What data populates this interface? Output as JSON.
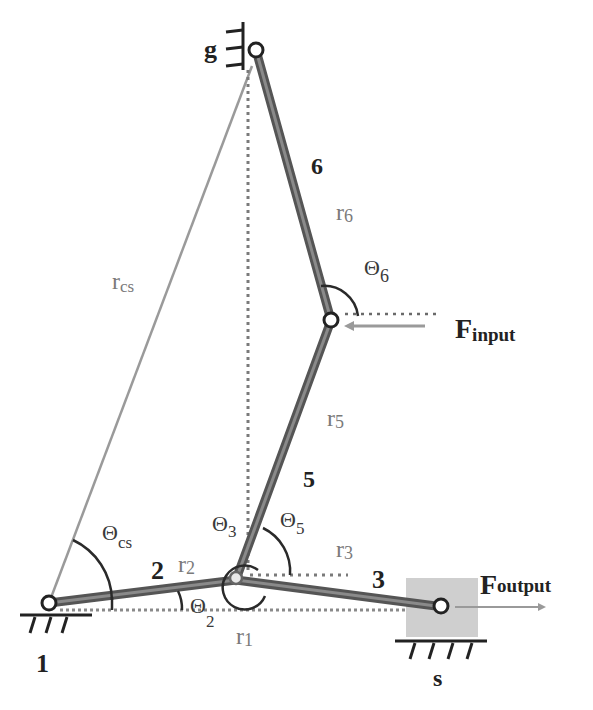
{
  "diagram": {
    "type": "mechanism-linkage",
    "colors": {
      "link": "#5a5a5a",
      "link_core": "#8a8a8a",
      "vector_line": "#9a9a9a",
      "dotted_line": "#7a7a7a",
      "arc": "#2a2a2a",
      "slider_fill": "#cfcfcf",
      "label_black": "#222222",
      "label_gray": "#7a7a7a"
    },
    "nodes": {
      "n1": {
        "label": "1",
        "x": 49,
        "y": 603
      },
      "g": {
        "label": "g",
        "x": 256,
        "y": 50
      },
      "input_joint": {
        "x": 331,
        "y": 320
      },
      "center_joint": {
        "x": 236,
        "y": 578
      },
      "s": {
        "label": "s",
        "x": 441,
        "y": 606
      }
    },
    "links": [
      {
        "id": "2",
        "label": "2",
        "from": "n1",
        "to": "center_joint"
      },
      {
        "id": "3",
        "label": "3",
        "from": "center_joint",
        "to": "s"
      },
      {
        "id": "5",
        "label": "5",
        "from": "center_joint",
        "to": "input_joint"
      },
      {
        "id": "6",
        "label": "6",
        "from": "input_joint",
        "to": "g"
      }
    ],
    "vector_labels": {
      "r1": {
        "base": "r",
        "sub": "1"
      },
      "r2": {
        "base": "r",
        "sub": "2"
      },
      "r3": {
        "base": "r",
        "sub": "3"
      },
      "r5": {
        "base": "r",
        "sub": "5"
      },
      "r6": {
        "base": "r",
        "sub": "6"
      },
      "rcs": {
        "base": "r",
        "sub": "cs"
      }
    },
    "angle_labels": {
      "theta2": {
        "base": "Θ",
        "sub": "2"
      },
      "theta3": {
        "base": "Θ",
        "sub": "3"
      },
      "theta5": {
        "base": "Θ",
        "sub": "5"
      },
      "theta6": {
        "base": "Θ",
        "sub": "6"
      },
      "thetacs": {
        "base": "Θ",
        "sub": "cs"
      }
    },
    "forces": {
      "input": {
        "base": "F",
        "sub": "input",
        "direction": "left"
      },
      "output": {
        "base": "F",
        "sub": "output",
        "direction": "right"
      }
    },
    "link_numbers": {
      "l2": "2",
      "l3": "3",
      "l5": "5",
      "l6": "6"
    },
    "ground_labels": {
      "n1": "1",
      "g": "g",
      "s": "s"
    }
  }
}
